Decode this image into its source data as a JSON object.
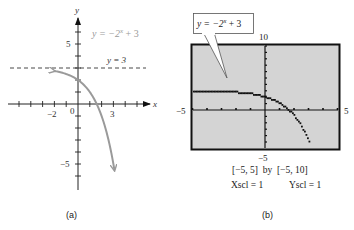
{
  "chart_data": [
    {
      "type": "line",
      "panel": "(a)",
      "title": "",
      "function": "y = -2^x + 3",
      "curve_label": "y = −2^x + 3",
      "asymptote": {
        "y": 3,
        "label": "y = 3",
        "style": "dashed"
      },
      "xlabel": "x",
      "ylabel": "y",
      "x_ticks_labeled": [
        {
          "value": -2,
          "label": "−2"
        },
        {
          "value": 3,
          "label": "3"
        }
      ],
      "y_ticks_labeled": [
        {
          "value": 5,
          "label": "5"
        },
        {
          "value": -5,
          "label": "−5"
        }
      ],
      "origin_label": "0",
      "x_range": [
        -6,
        6
      ],
      "y_range": [
        -7,
        7
      ],
      "curve_domain": [
        -2,
        3.09
      ],
      "sample_points": [
        {
          "x": -2,
          "y": 2.75
        },
        {
          "x": -1,
          "y": 2.5
        },
        {
          "x": 0,
          "y": 2
        },
        {
          "x": 1,
          "y": 1
        },
        {
          "x": 1.585,
          "y": 0
        },
        {
          "x": 2,
          "y": -1
        },
        {
          "x": 3,
          "y": -5
        }
      ],
      "grid": false,
      "curve_color": "#9a9a9a"
    },
    {
      "type": "line",
      "panel": "(b)",
      "title": "",
      "function": "y = -2^x + 3",
      "callout_label": "y = −2^x + 3",
      "window": {
        "xmin": -5,
        "xmax": 5,
        "ymin": -5,
        "ymax": 10,
        "xscl": 1,
        "yscl": 1
      },
      "edge_labels": {
        "left": "−5",
        "right": "5",
        "top": "10",
        "bottom": "−5"
      },
      "window_text": "[−5, 5]  by  [−5, 10]",
      "xscl_text": "Xscl = 1",
      "yscl_text": "Yscl = 1",
      "grid": false,
      "screen_color": "#d4d4d4"
    }
  ],
  "captions": {
    "a": "(a)",
    "b": "(b)"
  },
  "panel_a": {
    "axis_x_label": "x",
    "axis_y_label": "y",
    "curve_label_main": "y = −2",
    "curve_label_exp": "x",
    "curve_label_tail": " + 3",
    "asymptote_label": "y = 3",
    "tick_label_neg2": "−2",
    "tick_label_3": "3",
    "tick_label_5": "5",
    "tick_label_neg5": "−5",
    "origin_label": "0"
  },
  "panel_b": {
    "callout_main": "y = −2",
    "callout_exp": "x",
    "callout_tail": " + 3",
    "label_top": "10",
    "label_bottom": "−5",
    "label_left": "−5",
    "label_right": "5",
    "window_text": "[−5, 5]  by  [−5, 10]",
    "xscl_text": "Xscl = 1",
    "yscl_text": "Yscl = 1"
  }
}
